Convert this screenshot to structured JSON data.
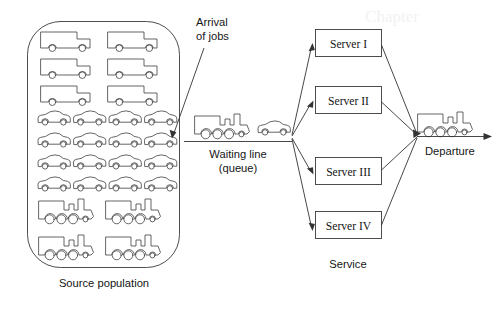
{
  "diagram": {
    "type": "queueing-system-flow",
    "colors": {
      "stroke": "#3a3a3a",
      "vehicle_stroke": "#4a4a4a",
      "flow_stroke": "#333333",
      "text": "#151515",
      "background": "#ffffff"
    },
    "labels": {
      "source_population": "Source population",
      "arrival_line1": "Arrival",
      "arrival_line2": "of jobs",
      "waiting_line1": "Waiting line",
      "waiting_line2": "(queue)",
      "service": "Service",
      "departure": "Departure"
    },
    "source_population": {
      "shape": "rounded-rectangle",
      "rows": [
        {
          "vehicle": "truck-icon",
          "count": 2
        },
        {
          "vehicle": "truck-icon",
          "count": 2
        },
        {
          "vehicle": "truck-icon",
          "count": 2
        },
        {
          "vehicle": "car-icon",
          "count": 4
        },
        {
          "vehicle": "car-icon",
          "count": 4
        },
        {
          "vehicle": "car-icon",
          "count": 4
        },
        {
          "vehicle": "car-icon",
          "count": 4
        },
        {
          "vehicle": "locomotive-icon",
          "count": 2
        },
        {
          "vehicle": "locomotive-icon",
          "count": 2
        }
      ],
      "totals": {
        "trucks": 6,
        "cars": 16,
        "locomotives": 4
      }
    },
    "queue": {
      "vehicles": [
        "locomotive-icon",
        "car-icon"
      ],
      "orientation": "horizontal"
    },
    "servers": [
      {
        "label": "Server I"
      },
      {
        "label": "Server II"
      },
      {
        "label": "Server III"
      },
      {
        "label": "Server IV"
      }
    ],
    "departure": {
      "vehicle": "locomotive-icon",
      "direction": "right"
    },
    "bleed_through_text": "Chapter"
  }
}
